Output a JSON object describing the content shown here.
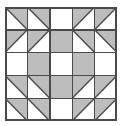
{
  "figure": {
    "title": "Quilt Block Pattern",
    "kind": "geometric-tile-grid",
    "rows": 5,
    "columns": 5
  },
  "colors": {
    "fill_light": "#ffffff",
    "fill_shade": "#bdbdbd",
    "line": "#4a4a4a",
    "line_soft": "#6e6e6e",
    "background": "#ffffff"
  },
  "geometry": {
    "canvas_width": 121,
    "canvas_height": 126,
    "block_x": 5,
    "block_y": 7,
    "block_width": 112,
    "block_height": 114,
    "cell_width": 22.4,
    "cell_height": 22.8,
    "outer_stroke": 1.6,
    "grid_stroke": 1.4,
    "diagonal_stroke": 1.4
  },
  "cells": [
    [
      {
        "name": "half-square-triangle",
        "fill": "shade-upper-right",
        "diagonal": "tl-br"
      },
      {
        "name": "half-square-triangle",
        "fill": "shade-upper-right",
        "diagonal": "tl-br"
      },
      {
        "name": "plain-square",
        "fill": "light",
        "diagonal": "none"
      },
      {
        "name": "half-square-triangle",
        "fill": "shade-upper-left",
        "diagonal": "bl-tr"
      },
      {
        "name": "half-square-triangle",
        "fill": "shade-upper-left",
        "diagonal": "bl-tr"
      }
    ],
    [
      {
        "name": "half-square-triangle",
        "fill": "shade-upper-left",
        "diagonal": "bl-tr"
      },
      {
        "name": "half-square-triangle",
        "fill": "shade-upper-left",
        "diagonal": "bl-tr"
      },
      {
        "name": "plain-square",
        "fill": "shade",
        "diagonal": "none"
      },
      {
        "name": "half-square-triangle",
        "fill": "shade-upper-right",
        "diagonal": "tl-br"
      },
      {
        "name": "half-square-triangle",
        "fill": "shade-upper-right",
        "diagonal": "tl-br"
      }
    ],
    [
      {
        "name": "plain-square",
        "fill": "light",
        "diagonal": "none"
      },
      {
        "name": "plain-square",
        "fill": "shade",
        "diagonal": "none"
      },
      {
        "name": "plain-square",
        "fill": "light",
        "diagonal": "none"
      },
      {
        "name": "plain-square",
        "fill": "shade",
        "diagonal": "none"
      },
      {
        "name": "plain-square",
        "fill": "light",
        "diagonal": "none"
      }
    ],
    [
      {
        "name": "half-square-triangle",
        "fill": "shade-upper-right",
        "diagonal": "tl-br"
      },
      {
        "name": "half-square-triangle",
        "fill": "shade-upper-right",
        "diagonal": "tl-br"
      },
      {
        "name": "plain-square",
        "fill": "shade",
        "diagonal": "none"
      },
      {
        "name": "half-square-triangle",
        "fill": "shade-upper-left",
        "diagonal": "bl-tr"
      },
      {
        "name": "half-square-triangle",
        "fill": "shade-upper-left",
        "diagonal": "bl-tr"
      }
    ],
    [
      {
        "name": "half-square-triangle",
        "fill": "shade-upper-right",
        "diagonal": "tl-br"
      },
      {
        "name": "half-square-triangle",
        "fill": "shade-upper-right",
        "diagonal": "tl-br"
      },
      {
        "name": "plain-square",
        "fill": "light",
        "diagonal": "none"
      },
      {
        "name": "half-square-triangle",
        "fill": "shade-upper-left",
        "diagonal": "bl-tr"
      },
      {
        "name": "half-square-triangle",
        "fill": "shade-upper-left",
        "diagonal": "bl-tr"
      }
    ]
  ]
}
